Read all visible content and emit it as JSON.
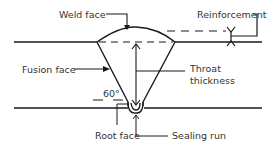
{
  "diagram": {
    "type": "single-V butt weld cross-section",
    "labels": {
      "weld_face": "Weld face",
      "reinforcement": "Reinforcement",
      "fusion_face": "Fusion face",
      "throat_line1": "Throat",
      "throat_line2": "thickness",
      "angle": "60°",
      "root_face": "Root face",
      "sealing_run": "Sealing run"
    },
    "colors": {
      "line": "#1a1a1a",
      "text": "#333333",
      "background": "#ffffff"
    }
  }
}
